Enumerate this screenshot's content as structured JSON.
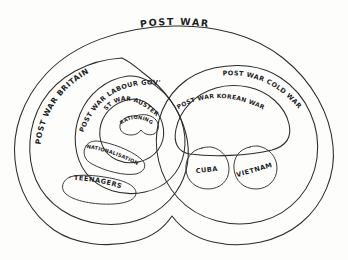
{
  "diagram": {
    "kind": "hand-drawn-nested-set-diagram",
    "title": "POST WAR",
    "ink_color": "#2b2b2b",
    "background_color": "#fdfdfc",
    "regions": {
      "outer": {
        "label": "POST WAR"
      },
      "britain": {
        "label": "POST WAR BRITAIN"
      },
      "labour_govt": {
        "label": "POST WAR LABOUR GOV'T"
      },
      "austerity": {
        "label": "POST WAR AUSTERITY"
      },
      "rationing": {
        "label": "RATIONING"
      },
      "nationalisation": {
        "label": "NATIONALISATION"
      },
      "teenagers": {
        "label": "TEENAGERS"
      },
      "cold_war": {
        "label": "POST WAR COLD WAR"
      },
      "korean_war": {
        "label": "POST WAR KOREAN WAR"
      },
      "cuba": {
        "label": "CUBA"
      },
      "vietnam": {
        "label": "VIETNAM"
      }
    }
  }
}
